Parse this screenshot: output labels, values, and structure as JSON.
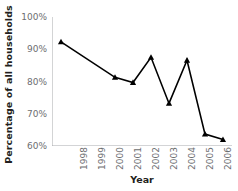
{
  "chart_data": {
    "type": "line",
    "title": "",
    "xlabel": "Year",
    "ylabel": "Percentage of all households",
    "categories": [
      "1998",
      "1999",
      "2000",
      "2001",
      "2002",
      "2003",
      "2004",
      "2005",
      "2006",
      "2007"
    ],
    "values": [
      92.3,
      null,
      null,
      81.3,
      79.7,
      87.5,
      73.2,
      86.6,
      63.7,
      62.0
    ],
    "series": [
      {
        "name": "Percentage of all households",
        "points": [
          {
            "x": "1998",
            "y": 92.3,
            "marker": true
          },
          {
            "x": "2001",
            "y": 81.3,
            "marker": true
          },
          {
            "x": "2002",
            "y": 79.7,
            "marker": true
          },
          {
            "x": "2003",
            "y": 87.5,
            "marker": true
          },
          {
            "x": "2004",
            "y": 73.2,
            "marker": true
          },
          {
            "x": "2005",
            "y": 86.6,
            "marker": true
          },
          {
            "x": "2006",
            "y": 63.7,
            "marker": true
          },
          {
            "x": "2007",
            "y": 62.0,
            "marker": true
          }
        ]
      }
    ],
    "ylim": [
      60,
      100
    ],
    "ytick_values": [
      60,
      70,
      80,
      90,
      100
    ],
    "ytick_labels": [
      "60%",
      "70%",
      "80%",
      "90%",
      "100%"
    ],
    "grid": false,
    "legend": false,
    "marker_shape": "triangle",
    "line_color": "#000000",
    "marker_color": "#000000",
    "axis_color": "#a7a9ac",
    "tick_label_color": "#6d6e71",
    "axis_title_color": "#231f20"
  }
}
